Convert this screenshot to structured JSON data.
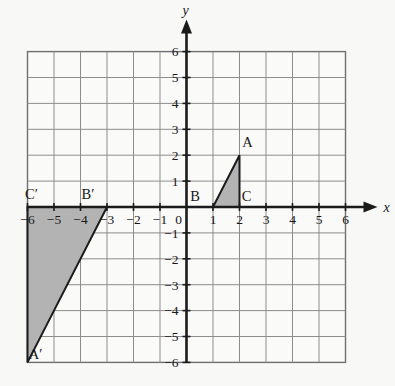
{
  "figure": {
    "background_color": "#f8f8f7",
    "plot_background_color": "#fafaf9",
    "grid_color": "#8d8d8d",
    "axis_color": "#1b1b1b",
    "shape_fill_color": "#b3b3b3",
    "shape_stroke_color": "#1b1b1b"
  },
  "axes": {
    "x_axis_name": "x",
    "y_axis_name": "y",
    "x_min": -6,
    "x_max": 6,
    "y_min": -6,
    "y_max": 6,
    "step": 1,
    "origin_label": "0",
    "x_tick_labels": [
      "−6",
      "−5",
      "−4",
      "−3",
      "−2",
      "−1",
      "1",
      "2",
      "3",
      "4",
      "5",
      "6"
    ],
    "x_tick_values": [
      -6,
      -5,
      -4,
      -3,
      -2,
      -1,
      1,
      2,
      3,
      4,
      5,
      6
    ],
    "y_tick_labels": [
      "6",
      "5",
      "4",
      "3",
      "2",
      "1",
      "−1",
      "−2",
      "−3",
      "−4",
      "−5",
      "−6"
    ],
    "y_tick_values": [
      6,
      5,
      4,
      3,
      2,
      1,
      -1,
      -2,
      -3,
      -4,
      -5,
      -6
    ]
  },
  "chart_data": {
    "type": "scatter",
    "title": "",
    "xlabel": "x",
    "ylabel": "y",
    "xlim": [
      -6,
      6
    ],
    "ylim": [
      -6,
      6
    ],
    "grid": true,
    "legend": "none",
    "shapes": [
      {
        "name": "triangle-abc",
        "kind": "polygon",
        "fill": "#b3b3b3",
        "vertices": [
          {
            "label": "A",
            "x": 2,
            "y": 2
          },
          {
            "label": "B",
            "x": 1,
            "y": 0
          },
          {
            "label": "C",
            "x": 2,
            "y": 0
          }
        ]
      },
      {
        "name": "triangle-a-prime-b-prime-c-prime",
        "kind": "polygon",
        "fill": "#b3b3b3",
        "vertices": [
          {
            "label": "A′",
            "x": -6,
            "y": -6
          },
          {
            "label": "B′",
            "x": -3,
            "y": 0
          },
          {
            "label": "C′",
            "x": -6,
            "y": 0
          }
        ]
      }
    ],
    "point_labels": [
      {
        "text": "A",
        "x": 2,
        "y": 2,
        "dx": 8,
        "dy": -8
      },
      {
        "text": "B",
        "x": 1,
        "y": 0,
        "dx": -18,
        "dy": -6
      },
      {
        "text": "C",
        "x": 2,
        "y": 0,
        "dx": 7,
        "dy": -6
      },
      {
        "text": "A′",
        "x": -6,
        "y": -6,
        "dx": 8,
        "dy": -3
      },
      {
        "text": "B′",
        "x": -3,
        "y": 0,
        "dx": -19,
        "dy": -8
      },
      {
        "text": "C′",
        "x": -6,
        "y": 0,
        "dx": 4,
        "dy": -8
      }
    ]
  }
}
